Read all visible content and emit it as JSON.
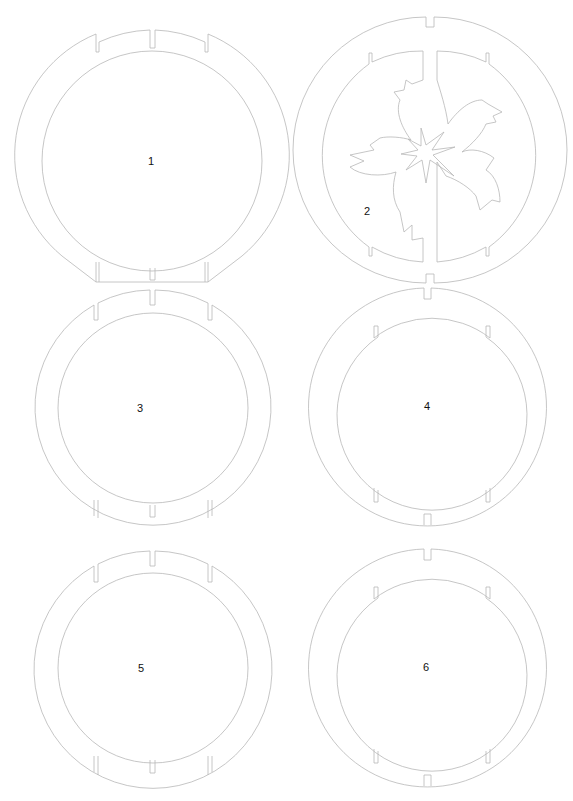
{
  "sheet": {
    "width": 573,
    "height": 801,
    "background": "#ffffff",
    "stroke_color": "#b8b8b8",
    "label_color": "#111111"
  },
  "pieces": [
    {
      "id": "1",
      "label": "1",
      "cx": 152,
      "cy": 161,
      "outer_r": 131,
      "inner_r": 110,
      "slots": "top-3 + bottom-3 inner notches",
      "bottom": "flattened chord",
      "label_pos": [
        152,
        165
      ]
    },
    {
      "id": "2",
      "label": "2",
      "cx": 430,
      "cy": 150,
      "outer_r": 133,
      "inner_r": 113,
      "slots": "top/bottom outer center notch, 4 inner corner tabs",
      "split": "vertical center gap",
      "motif": "sakura-flower",
      "label_pos": [
        369,
        215
      ]
    },
    {
      "id": "3",
      "label": "3",
      "cx": 153,
      "cy": 408,
      "outer_r": 118,
      "inner_r": 95,
      "slots": "top-3 + bottom-3 inner notches",
      "label_pos": [
        141,
        411
      ]
    },
    {
      "id": "4",
      "label": "4",
      "cx": 427,
      "cy": 406,
      "outer_r": 119,
      "inner_r": 95,
      "slots": "top/bottom outer center notch, 4 inner corner tabs",
      "label_pos": [
        427,
        410
      ]
    },
    {
      "id": "5",
      "label": "5",
      "cx": 153,
      "cy": 668,
      "outer_r": 119,
      "inner_r": 95,
      "slots": "top-3 + bottom-3 inner notches",
      "label_pos": [
        142,
        671
      ]
    },
    {
      "id": "6",
      "label": "6",
      "cx": 427,
      "cy": 667,
      "outer_r": 119,
      "inner_r": 95,
      "slots": "top/bottom outer center notch, 4 inner corner tabs",
      "label_pos": [
        426,
        670
      ]
    }
  ]
}
